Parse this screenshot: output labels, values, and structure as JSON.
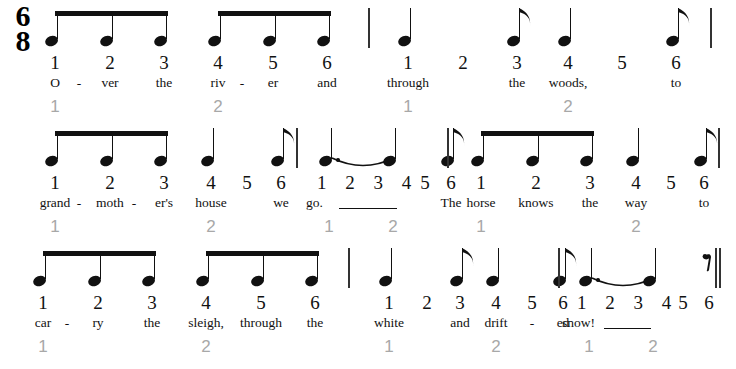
{
  "score": {
    "title_text": "",
    "time_signature": {
      "numerator": "6",
      "denominator": "8"
    },
    "colors": {
      "ink": "#111111",
      "pulse_gray": "#a8a8a8",
      "barline": "#333333"
    },
    "systems": [
      {
        "id": "system-0",
        "measures": [
          {
            "id": "m1",
            "pulses": [
              "1",
              "2"
            ],
            "beats": [
              {
                "n": "1",
                "lyric": "O",
                "hyphen_after": true,
                "note": "eighth-beamed"
              },
              {
                "n": "2",
                "lyric": "ver",
                "hyphen_after": false,
                "note": "eighth-beamed"
              },
              {
                "n": "3",
                "lyric": "the",
                "hyphen_after": false,
                "note": "eighth-beamed"
              },
              {
                "n": "4",
                "lyric": "riv",
                "hyphen_after": true,
                "note": "eighth-beamed"
              },
              {
                "n": "5",
                "lyric": "er",
                "hyphen_after": false,
                "note": "eighth-beamed"
              },
              {
                "n": "6",
                "lyric": "and",
                "hyphen_after": false,
                "note": "eighth-beamed"
              }
            ]
          },
          {
            "id": "m2",
            "pulses": [
              "1",
              "2"
            ],
            "beats": [
              {
                "n": "1",
                "lyric": "through",
                "hyphen_after": false,
                "note": "quarter"
              },
              {
                "n": "2",
                "lyric": "",
                "hyphen_after": false,
                "note": "none"
              },
              {
                "n": "3",
                "lyric": "the",
                "hyphen_after": false,
                "note": "eighth"
              },
              {
                "n": "4",
                "lyric": "woods,",
                "hyphen_after": false,
                "note": "quarter"
              },
              {
                "n": "5",
                "lyric": "",
                "hyphen_after": false,
                "note": "none"
              },
              {
                "n": "6",
                "lyric": "to",
                "hyphen_after": false,
                "note": "eighth"
              }
            ]
          }
        ],
        "end_barline": "single"
      },
      {
        "id": "system-1",
        "measures": [
          {
            "id": "m3",
            "pulses": [
              "1",
              "2"
            ],
            "beats": [
              {
                "n": "1",
                "lyric": "grand",
                "hyphen_after": true,
                "note": "eighth-beamed"
              },
              {
                "n": "2",
                "lyric": "moth",
                "hyphen_after": true,
                "note": "eighth-beamed"
              },
              {
                "n": "3",
                "lyric": "er's",
                "hyphen_after": false,
                "note": "eighth-beamed"
              },
              {
                "n": "4",
                "lyric": "house",
                "hyphen_after": false,
                "note": "quarter"
              },
              {
                "n": "5",
                "lyric": "",
                "hyphen_after": false,
                "note": "none"
              },
              {
                "n": "6",
                "lyric": "we",
                "hyphen_after": false,
                "note": "eighth"
              }
            ]
          },
          {
            "id": "m4",
            "pulses": [
              "1",
              "2"
            ],
            "held": {
              "beat_numbers": "1 2 3 4",
              "lyric": "go.",
              "extender": true
            },
            "beats": [
              {
                "n": "1",
                "lyric": "go.",
                "hyphen_after": false,
                "note": "dotted-quarter-tied"
              },
              {
                "n": "2",
                "lyric": "",
                "hyphen_after": false,
                "note": "none"
              },
              {
                "n": "3",
                "lyric": "",
                "hyphen_after": false,
                "note": "none"
              },
              {
                "n": "4",
                "lyric": "",
                "hyphen_after": false,
                "note": "tie-target-eighth"
              },
              {
                "n": "5",
                "lyric": "",
                "hyphen_after": false,
                "note": "none"
              },
              {
                "n": "6",
                "lyric": "The",
                "hyphen_after": false,
                "note": "eighth"
              }
            ]
          },
          {
            "id": "m5",
            "pulses": [
              "1",
              "2"
            ],
            "beats": [
              {
                "n": "1",
                "lyric": "horse",
                "hyphen_after": false,
                "note": "eighth-beamed"
              },
              {
                "n": "2",
                "lyric": "knows",
                "hyphen_after": false,
                "note": "eighth-beamed"
              },
              {
                "n": "3",
                "lyric": "the",
                "hyphen_after": false,
                "note": "eighth-beamed"
              },
              {
                "n": "4",
                "lyric": "way",
                "hyphen_after": false,
                "note": "quarter"
              },
              {
                "n": "5",
                "lyric": "",
                "hyphen_after": false,
                "note": "none"
              },
              {
                "n": "6",
                "lyric": "to",
                "hyphen_after": false,
                "note": "eighth"
              }
            ]
          }
        ],
        "end_barline": "single"
      },
      {
        "id": "system-2",
        "measures": [
          {
            "id": "m6",
            "pulses": [
              "1",
              "2"
            ],
            "beats": [
              {
                "n": "1",
                "lyric": "car",
                "hyphen_after": true,
                "note": "eighth-beamed"
              },
              {
                "n": "2",
                "lyric": "ry",
                "hyphen_after": false,
                "note": "eighth-beamed"
              },
              {
                "n": "3",
                "lyric": "the",
                "hyphen_after": false,
                "note": "eighth-beamed"
              },
              {
                "n": "4",
                "lyric": "sleigh,",
                "hyphen_after": false,
                "note": "eighth-beamed"
              },
              {
                "n": "5",
                "lyric": "through",
                "hyphen_after": false,
                "note": "eighth-beamed"
              },
              {
                "n": "6",
                "lyric": "the",
                "hyphen_after": false,
                "note": "eighth-beamed"
              }
            ]
          },
          {
            "id": "m7",
            "pulses": [
              "1",
              "2"
            ],
            "beats": [
              {
                "n": "1",
                "lyric": "white",
                "hyphen_after": false,
                "note": "quarter"
              },
              {
                "n": "2",
                "lyric": "",
                "hyphen_after": false,
                "note": "none"
              },
              {
                "n": "3",
                "lyric": "and",
                "hyphen_after": false,
                "note": "eighth"
              },
              {
                "n": "4",
                "lyric": "drift",
                "hyphen_after": false,
                "note": "quarter"
              },
              {
                "n": "5",
                "lyric": "",
                "hyphen_after": true,
                "note": "none"
              },
              {
                "n": "6",
                "lyric": "ed",
                "hyphen_after": false,
                "note": "eighth"
              }
            ]
          },
          {
            "id": "m8",
            "pulses": [
              "1",
              "2"
            ],
            "held": {
              "beat_numbers": "1 2 3 4",
              "lyric": "snow!",
              "extender": true
            },
            "beats": [
              {
                "n": "1",
                "lyric": "snow!",
                "hyphen_after": false,
                "note": "dotted-quarter-tied"
              },
              {
                "n": "2",
                "lyric": "",
                "hyphen_after": false,
                "note": "none"
              },
              {
                "n": "3",
                "lyric": "",
                "hyphen_after": false,
                "note": "none"
              },
              {
                "n": "4",
                "lyric": "",
                "hyphen_after": false,
                "note": "tie-target-eighth"
              },
              {
                "n": "5",
                "lyric": "",
                "hyphen_after": false,
                "note": "none"
              },
              {
                "n": "6",
                "lyric": "",
                "hyphen_after": false,
                "note": "eighth-rest"
              }
            ]
          }
        ],
        "end_barline": "final"
      }
    ]
  }
}
